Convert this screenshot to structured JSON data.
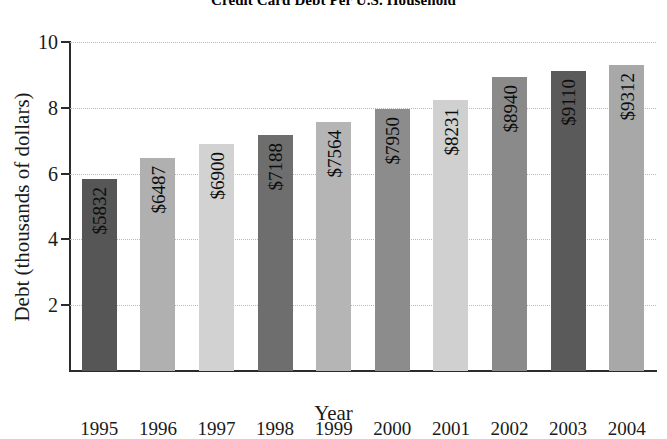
{
  "chart_data": {
    "type": "bar",
    "title": "Credit Card Debt Per U.S. Household",
    "xlabel": "Year",
    "ylabel": "Debt (thousands of dollars)",
    "categories": [
      "1995",
      "1996",
      "1997",
      "1998",
      "1999",
      "2000",
      "2001",
      "2002",
      "2003",
      "2004"
    ],
    "values": [
      5.832,
      6.487,
      6.9,
      7.188,
      7.564,
      7.95,
      8.231,
      8.94,
      9.11,
      9.312
    ],
    "data_labels": [
      "$5832",
      "$6487",
      "$6900",
      "$7188",
      "$7564",
      "$7950",
      "$8231",
      "$8940",
      "$9110",
      "$9312"
    ],
    "bar_colors": [
      "#565656",
      "#b0b0b0",
      "#d2d2d2",
      "#6e6e6e",
      "#b5b5b5",
      "#8c8c8c",
      "#d0d0d0",
      "#8a8a8a",
      "#5a5a5a",
      "#a8a8a8"
    ],
    "ylim": [
      0,
      10
    ],
    "yticks": [
      2,
      4,
      6,
      8,
      10
    ],
    "ytick_labels": [
      "2",
      "4",
      "6",
      "8",
      "10"
    ],
    "grid": true,
    "grid_axis": "y",
    "legend": "none",
    "units_note": "values are thousands of dollars; data labels show whole dollars"
  },
  "axis_colors": {
    "axis_line": "#2b2b2b",
    "gridline": "#b9b9b9",
    "text": "#1a1a1a",
    "background": "#ffffff"
  }
}
